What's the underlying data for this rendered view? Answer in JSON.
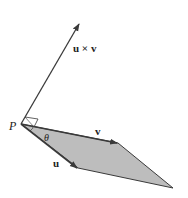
{
  "diagram": {
    "labels": {
      "cross": "u × v",
      "v": "v",
      "u": "u",
      "point": "P",
      "angle": "θ"
    },
    "colors": {
      "line": "#3a3a3a",
      "fill": "#bdbdbd",
      "text": "#222222",
      "background": "#ffffff"
    },
    "points": {
      "P": [
        21,
        124
      ],
      "cross_tip": [
        79,
        24
      ],
      "v_tip": [
        118,
        143
      ],
      "u_tip": [
        78,
        168
      ],
      "far_corner": [
        173,
        188
      ]
    }
  }
}
